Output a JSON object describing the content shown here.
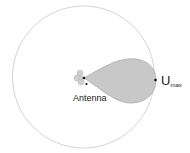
{
  "diagram": {
    "labels": {
      "antenna": "Antenna",
      "umax_main": "U",
      "umax_sub": "max"
    },
    "colors": {
      "circle_stroke": "#d4d4d4",
      "lobe_fill": "#c8c8c8",
      "lobe_stroke": "#9a9a9a",
      "antenna_fill": "#cfcfcf",
      "marker": "#111111"
    }
  }
}
